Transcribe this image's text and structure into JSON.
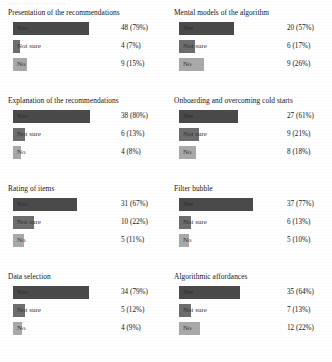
{
  "figure": {
    "top_artifact_text": "........ ...... ... .... .........",
    "bar_max_width_px": 96,
    "colors": {
      "yes": "#4a4a4a",
      "not_sure": "#6e6e6e",
      "no": "#a9a9a9",
      "background": "#ffffff",
      "text": "#16181a"
    }
  },
  "chart_data": {
    "type": "bar",
    "title": "",
    "xlabel": "",
    "ylabel": "",
    "orientation": "horizontal",
    "categories": [
      "Yes",
      "Not sure",
      "No"
    ],
    "grid": false,
    "legend": "none",
    "value_format": "count (percent)",
    "panels": [
      {
        "title": "Presentation of the recommendations",
        "bars": [
          {
            "category": "Yes",
            "count": 48,
            "percent": 79,
            "value_label": "48 (79%)"
          },
          {
            "category": "Not sure",
            "count": 4,
            "percent": 7,
            "value_label": "4 (7%)"
          },
          {
            "category": "No",
            "count": 9,
            "percent": 15,
            "value_label": "9 (15%)"
          }
        ]
      },
      {
        "title": "Mental models of the algorithm",
        "bars": [
          {
            "category": "Yes",
            "count": 20,
            "percent": 57,
            "value_label": "20 (57%)"
          },
          {
            "category": "Not sure",
            "count": 6,
            "percent": 17,
            "value_label": "6 (17%)"
          },
          {
            "category": "No",
            "count": 9,
            "percent": 26,
            "value_label": "9 (26%)"
          }
        ]
      },
      {
        "title": "Explanation of the recommendations",
        "bars": [
          {
            "category": "Yes",
            "count": 38,
            "percent": 80,
            "value_label": "38 (80%)"
          },
          {
            "category": "Not sure",
            "count": 6,
            "percent": 13,
            "value_label": "6 (13%)"
          },
          {
            "category": "No",
            "count": 4,
            "percent": 8,
            "value_label": "4 (8%)"
          }
        ]
      },
      {
        "title": "Onboarding and overcoming cold starts",
        "bars": [
          {
            "category": "Yes",
            "count": 27,
            "percent": 61,
            "value_label": "27 (61%)"
          },
          {
            "category": "Not sure",
            "count": 9,
            "percent": 21,
            "value_label": "9 (21%)"
          },
          {
            "category": "No",
            "count": 8,
            "percent": 18,
            "value_label": "8 (18%)"
          }
        ]
      },
      {
        "title": "Rating of items",
        "bars": [
          {
            "category": "Yes",
            "count": 31,
            "percent": 67,
            "value_label": "31 (67%)"
          },
          {
            "category": "Not sure",
            "count": 10,
            "percent": 22,
            "value_label": "10 (22%)"
          },
          {
            "category": "No",
            "count": 5,
            "percent": 11,
            "value_label": "5 (11%)"
          }
        ]
      },
      {
        "title": "Filter bubble",
        "bars": [
          {
            "category": "Yes",
            "count": 37,
            "percent": 77,
            "value_label": "37 (77%)"
          },
          {
            "category": "Not sure",
            "count": 6,
            "percent": 13,
            "value_label": "6 (13%)"
          },
          {
            "category": "No",
            "count": 5,
            "percent": 10,
            "value_label": "5 (10%)"
          }
        ]
      },
      {
        "title": "Data selection",
        "bars": [
          {
            "category": "Yes",
            "count": 34,
            "percent": 79,
            "value_label": "34 (79%)"
          },
          {
            "category": "Not sure",
            "count": 5,
            "percent": 12,
            "value_label": "5 (12%)"
          },
          {
            "category": "No",
            "count": 4,
            "percent": 9,
            "value_label": "4 (9%)"
          }
        ]
      },
      {
        "title": "Algorithmic affordances",
        "bars": [
          {
            "category": "Yes",
            "count": 35,
            "percent": 64,
            "value_label": "35 (64%)"
          },
          {
            "category": "Not sure",
            "count": 7,
            "percent": 13,
            "value_label": "7 (13%)"
          },
          {
            "category": "No",
            "count": 12,
            "percent": 22,
            "value_label": "12 (22%)"
          }
        ]
      }
    ]
  }
}
